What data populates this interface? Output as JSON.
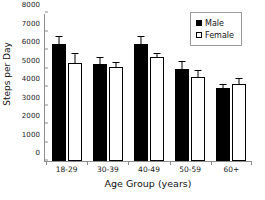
{
  "chart_data": {
    "type": "bar",
    "title": "",
    "xlabel": "Age Group (years)",
    "ylabel": "Steps per Day",
    "categories": [
      "18-29",
      "30-39",
      "40-49",
      "50-59",
      "60+"
    ],
    "ylim": [
      0,
      8000
    ],
    "yticks": [
      0,
      1000,
      2000,
      3000,
      4000,
      5000,
      6000,
      7000,
      8000
    ],
    "ytick_labels": [
      "0",
      "1000",
      "2000",
      "3000",
      "4000",
      "5000",
      "6000",
      "7000",
      "8000"
    ],
    "grid": false,
    "legend_position": "top-right",
    "series": [
      {
        "name": "Male",
        "color": "#000000",
        "values": [
          6300,
          5250,
          6350,
          5000,
          3950
        ],
        "errors": [
          400,
          330,
          330,
          350,
          170
        ]
      },
      {
        "name": "Female",
        "color": "#ffffff",
        "values": [
          5300,
          5080,
          5600,
          4540,
          4180
        ],
        "errors": [
          480,
          200,
          160,
          330,
          230
        ]
      }
    ]
  },
  "legend": {
    "items": [
      {
        "label": "Male",
        "marker": "filled-square-icon"
      },
      {
        "label": "Female",
        "marker": "open-square-icon"
      }
    ]
  }
}
